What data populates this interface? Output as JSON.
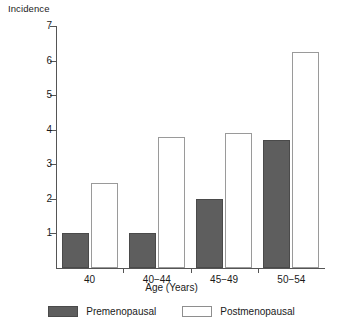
{
  "chart_data": {
    "type": "bar",
    "title": "",
    "ylabel": "Incidence",
    "xlabel": "Age (Years)",
    "categories": [
      "40",
      "40−44",
      "45−49",
      "50−54"
    ],
    "series": [
      {
        "name": "Premenopausal",
        "values": [
          1.0,
          1.0,
          2.0,
          3.7
        ],
        "color": "#5e5e5e"
      },
      {
        "name": "Postmenopausal",
        "values": [
          2.45,
          3.8,
          3.9,
          6.25
        ],
        "color": "#ffffff"
      }
    ],
    "ylim": [
      0,
      7
    ],
    "yticks": [
      1,
      2,
      3,
      4,
      5,
      6,
      7
    ],
    "ytick_labels": [
      "1",
      "2",
      "3",
      "4",
      "5",
      "6",
      "7"
    ],
    "grid": false,
    "legend_position": "bottom"
  },
  "legend": {
    "items": [
      {
        "label": "Premenopausal"
      },
      {
        "label": "Postmenopausal"
      }
    ]
  }
}
